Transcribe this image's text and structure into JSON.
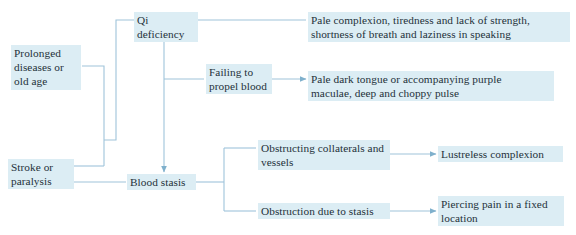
{
  "diagram": {
    "type": "flowchart",
    "colors": {
      "background": "#ffffff",
      "node_highlight": "#dcedf4",
      "text": "#24313a",
      "connector": "#9fc4da"
    },
    "nodes": [
      {
        "id": "prolonged-diseases",
        "label": "Prolonged\ndiseases or\nold age"
      },
      {
        "id": "stroke-paralysis",
        "label": "Stroke or\nparalysis"
      },
      {
        "id": "qi-deficiency",
        "label": "Qi deficiency"
      },
      {
        "id": "failing-to-propel-blood",
        "label": "Failing to\npropel blood"
      },
      {
        "id": "blood-stasis",
        "label": "Blood stasis"
      },
      {
        "id": "pale-complexion",
        "label": "Pale complexion, tiredness and lack of strength,\nshortness of breath and laziness in speaking"
      },
      {
        "id": "pale-dark-tongue",
        "label": "Pale dark tongue or accompanying purple\nmaculae, deep and choppy pulse"
      },
      {
        "id": "obstructing-collaterals",
        "label": "Obstructing collaterals and\nvessels"
      },
      {
        "id": "obstruction-due-to-stasis",
        "label": "Obstruction due to stasis"
      },
      {
        "id": "lustreless-complexion",
        "label": "Lustreless complexion"
      },
      {
        "id": "piercing-pain",
        "label": "Piercing pain in a fixed\nlocation"
      }
    ],
    "edges": [
      {
        "from": "prolonged-diseases",
        "to": "qi-deficiency",
        "arrow": false
      },
      {
        "from": "stroke-paralysis",
        "to": "qi-deficiency",
        "arrow": false
      },
      {
        "from": "qi-deficiency",
        "to": "pale-complexion",
        "arrow": false
      },
      {
        "from": "qi-deficiency",
        "to": "failing-to-propel-blood",
        "arrow": false
      },
      {
        "from": "qi-deficiency",
        "to": "blood-stasis",
        "arrow": true
      },
      {
        "from": "failing-to-propel-blood",
        "to": "pale-dark-tongue",
        "arrow": true
      },
      {
        "from": "stroke-paralysis",
        "to": "blood-stasis",
        "arrow": false
      },
      {
        "from": "blood-stasis",
        "to": "obstructing-collaterals",
        "arrow": false
      },
      {
        "from": "blood-stasis",
        "to": "obstruction-due-to-stasis",
        "arrow": false
      },
      {
        "from": "obstructing-collaterals",
        "to": "lustreless-complexion",
        "arrow": true
      },
      {
        "from": "obstruction-due-to-stasis",
        "to": "piercing-pain",
        "arrow": true
      }
    ]
  }
}
